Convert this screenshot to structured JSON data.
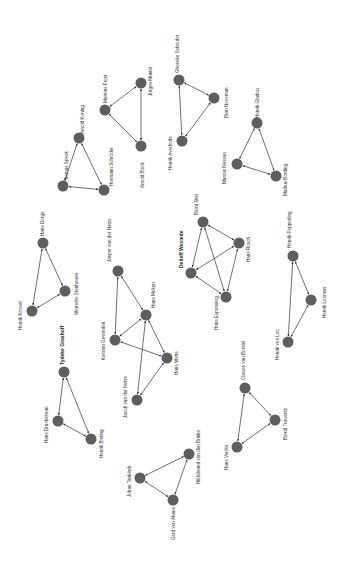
{
  "diagram": {
    "type": "network-graph",
    "node_color": "#5e5e5e",
    "edge_color": "#333333",
    "background": "#ffffff",
    "label_rotation": -90,
    "clusters": [
      {
        "id": "a",
        "nodes": [
          {
            "id": "arnold_koning",
            "label": "Arnold Koning",
            "x": 79,
            "y": 138,
            "lx": 84,
            "ly": 134
          },
          {
            "id": "thomas_speek",
            "label": "Thomas Speek",
            "x": 63,
            "y": 186,
            "lx": 68,
            "ly": 182
          },
          {
            "id": "hermann_schroder",
            "label": "Hermann Schröder",
            "x": 104,
            "y": 190,
            "lx": 113,
            "ly": 186
          }
        ],
        "edges": [
          [
            "arnold_koning",
            "thomas_speek"
          ],
          [
            "arnold_koning",
            "hermann_schroder"
          ],
          [
            "thomas_speek",
            "hermann_schroder"
          ]
        ]
      },
      {
        "id": "b",
        "nodes": [
          {
            "id": "mertens_frost",
            "label": "Mertens Frost",
            "x": 105,
            "y": 110,
            "lx": 107,
            "ly": 103
          },
          {
            "id": "jurgen_munter",
            "label": "Jürgen Munter",
            "x": 141,
            "y": 83,
            "lx": 152,
            "ly": 96
          },
          {
            "id": "arnold_block",
            "label": "Arnold Block",
            "x": 141,
            "y": 146,
            "lx": 144,
            "ly": 188
          }
        ],
        "edges": [
          [
            "mertens_frost",
            "jurgen_munter"
          ],
          [
            "mertens_frost",
            "arnold_block"
          ],
          [
            "jurgen_munter",
            "arnold_block"
          ]
        ]
      },
      {
        "id": "c",
        "nodes": [
          {
            "id": "gheseke_schroder",
            "label": "Gheseke Schroder",
            "x": 179,
            "y": 80,
            "lx": 179,
            "ly": 73
          },
          {
            "id": "brun_noveman",
            "label": "Brun Noveman",
            "x": 214,
            "y": 98,
            "lx": 228,
            "ly": 118
          },
          {
            "id": "henrik_averbode",
            "label": "Henrik Averbode",
            "x": 182,
            "y": 141,
            "lx": 172,
            "ly": 170
          }
        ],
        "edges": [
          [
            "gheseke_schroder",
            "brun_noveman"
          ],
          [
            "gheseke_schroder",
            "henrik_averbode"
          ],
          [
            "brun_noveman",
            "henrik_averbode"
          ]
        ]
      },
      {
        "id": "d",
        "nodes": [
          {
            "id": "henrik_gladow",
            "label": "Henrik Gladow",
            "x": 257,
            "y": 123,
            "lx": 259,
            "ly": 118
          },
          {
            "id": "marcus_nessen",
            "label": "Marcus Nessen",
            "x": 237,
            "y": 164,
            "lx": 226,
            "ly": 184
          },
          {
            "id": "markus_bording",
            "label": "Markus Bording",
            "x": 276,
            "y": 176,
            "lx": 287,
            "ly": 196
          }
        ],
        "edges": [
          [
            "henrik_gladow",
            "marcus_nessen"
          ],
          [
            "henrik_gladow",
            "markus_bording"
          ],
          [
            "marcus_nessen",
            "markus_bording"
          ]
        ]
      },
      {
        "id": "e",
        "nodes": [
          {
            "id": "hans_dorge",
            "label": "Hans Dorge",
            "x": 43,
            "y": 243,
            "lx": 44,
            "ly": 236
          },
          {
            "id": "wernebe_stenhouen",
            "label": "Wernebe Stenhouen",
            "x": 65,
            "y": 291,
            "lx": 78,
            "ly": 315
          },
          {
            "id": "henrik_krowet",
            "label": "Henrik Krowet",
            "x": 32,
            "y": 311,
            "lx": 22,
            "ly": 330
          }
        ],
        "edges": [
          [
            "hans_dorge",
            "wernebe_stenhouen"
          ],
          [
            "hans_dorge",
            "henrik_krowet"
          ],
          [
            "wernebe_stenhouen",
            "henrik_krowet"
          ]
        ]
      },
      {
        "id": "f",
        "nodes": [
          {
            "id": "jasper_van_der_netze",
            "label": "Jasper van der Netze",
            "x": 118,
            "y": 271,
            "lx": 111,
            "ly": 262
          },
          {
            "id": "hans_moken",
            "label": "Hans Moken",
            "x": 146,
            "y": 315,
            "lx": 155,
            "ly": 308
          },
          {
            "id": "kersten_gevenden",
            "label": "Kersten Gevenden",
            "x": 115,
            "y": 340,
            "lx": 105,
            "ly": 360
          },
          {
            "id": "hans_wytte",
            "label": "Hans Wytte",
            "x": 167,
            "y": 358,
            "lx": 178,
            "ly": 375
          },
          {
            "id": "jacob_van_der_netze",
            "label": "Jacob van der Netze",
            "x": 137,
            "y": 400,
            "lx": 127,
            "ly": 418
          }
        ],
        "edges": [
          [
            "jasper_van_der_netze",
            "hans_moken"
          ],
          [
            "jasper_van_der_netze",
            "kersten_gevenden"
          ],
          [
            "hans_moken",
            "kersten_gevenden"
          ],
          [
            "hans_moken",
            "hans_wytte"
          ],
          [
            "hans_moken",
            "jacob_van_der_netze"
          ],
          [
            "kersten_gevenden",
            "hans_wytte"
          ],
          [
            "hans_wytte",
            "jacob_van_der_netze"
          ]
        ]
      },
      {
        "id": "g",
        "nodes": [
          {
            "id": "bernt_stiel",
            "label": "Bernt Stiel",
            "x": 203,
            "y": 222,
            "lx": 198,
            "ly": 215
          },
          {
            "id": "hans_rosch",
            "label": "Hans Rosch",
            "x": 239,
            "y": 243,
            "lx": 250,
            "ly": 262
          },
          {
            "id": "detleff_westede",
            "label": "Detleff Westede",
            "x": 191,
            "y": 273,
            "lx": 183,
            "ly": 268,
            "bold": true
          },
          {
            "id": "hans_espensteg",
            "label": "Hans Espensteg",
            "x": 226,
            "y": 297,
            "lx": 218,
            "ly": 330
          }
        ],
        "edges": [
          [
            "bernt_stiel",
            "hans_rosch"
          ],
          [
            "bernt_stiel",
            "detleff_westede"
          ],
          [
            "bernt_stiel",
            "hans_espensteg"
          ],
          [
            "hans_rosch",
            "detleff_westede"
          ],
          [
            "hans_rosch",
            "hans_espensteg"
          ],
          [
            "detleff_westede",
            "hans_espensteg"
          ]
        ]
      },
      {
        "id": "h",
        "nodes": [
          {
            "id": "henrik_pepperling",
            "label": "Henrik Pepperling",
            "x": 293,
            "y": 256,
            "lx": 291,
            "ly": 248
          },
          {
            "id": "henrik_looman",
            "label": "Henrik Looman",
            "x": 311,
            "y": 300,
            "lx": 326,
            "ly": 318
          },
          {
            "id": "henrik_von_loo",
            "label": "Henrik von Loo",
            "x": 288,
            "y": 342,
            "lx": 279,
            "ly": 360
          }
        ],
        "edges": [
          [
            "henrik_pepperling",
            "henrik_looman"
          ],
          [
            "henrik_pepperling",
            "henrik_von_loo"
          ],
          [
            "henrik_looman",
            "henrik_von_loo"
          ]
        ]
      },
      {
        "id": "i",
        "nodes": [
          {
            "id": "tydeke_grashoff",
            "label": "Tydeke Grashoff",
            "x": 64,
            "y": 372,
            "lx": 64,
            "ly": 365,
            "bold": true
          },
          {
            "id": "hans_druckelman",
            "label": "Hans Druckelman",
            "x": 58,
            "y": 421,
            "lx": 48,
            "ly": 443
          },
          {
            "id": "henrik_bleting",
            "label": "Henrik Bleting",
            "x": 91,
            "y": 439,
            "lx": 103,
            "ly": 458
          }
        ],
        "edges": [
          [
            "tydeke_grashoff",
            "hans_druckelman"
          ],
          [
            "tydeke_grashoff",
            "henrik_bleting"
          ],
          [
            "hans_druckelman",
            "henrik_bleting"
          ]
        ]
      },
      {
        "id": "j",
        "nodes": [
          {
            "id": "clawes_van_borstel",
            "label": "Clawes van Borstel",
            "x": 245,
            "y": 388,
            "lx": 245,
            "ly": 380
          },
          {
            "id": "bernd_trawentz",
            "label": "Bernd Trawentz",
            "x": 275,
            "y": 420,
            "lx": 287,
            "ly": 440
          },
          {
            "id": "hans_verder",
            "label": "Hans Verder",
            "x": 237,
            "y": 447,
            "lx": 228,
            "ly": 470
          }
        ],
        "edges": [
          [
            "clawes_van_borstel",
            "bernd_trawentz"
          ],
          [
            "clawes_van_borstel",
            "hans_verder"
          ],
          [
            "bernd_trawentz",
            "hans_verder"
          ]
        ]
      },
      {
        "id": "k",
        "nodes": [
          {
            "id": "johan_tankinck",
            "label": "Johan Tankinck",
            "x": 140,
            "y": 478,
            "lx": 131,
            "ly": 497
          },
          {
            "id": "hildebrand_von_den_brinke",
            "label": "Hildebrand von den Brinke",
            "x": 189,
            "y": 454,
            "lx": 200,
            "ly": 484
          },
          {
            "id": "gerd_von_ahaus",
            "label": "Gerd von Ahaus",
            "x": 173,
            "y": 500,
            "lx": 175,
            "ly": 540
          }
        ],
        "edges": [
          [
            "johan_tankinck",
            "hildebrand_von_den_brinke"
          ],
          [
            "johan_tankinck",
            "gerd_von_ahaus"
          ],
          [
            "hildebrand_von_den_brinke",
            "gerd_von_ahaus"
          ]
        ]
      }
    ]
  }
}
